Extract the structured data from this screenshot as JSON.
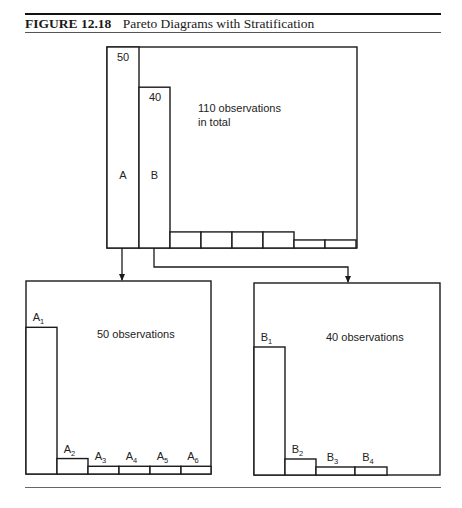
{
  "figure": {
    "number": "FIGURE 12.18",
    "title": "Pareto Diagrams with Stratification"
  },
  "chart_data": [
    {
      "type": "bar",
      "id": "overall",
      "annotation": [
        "110 observations",
        "in total"
      ],
      "categories": [
        "A",
        "B",
        "",
        "",
        "",
        "",
        "",
        ""
      ],
      "values": [
        50,
        40,
        4,
        4,
        4,
        4,
        2,
        2
      ],
      "value_labels": [
        "50",
        "40",
        "",
        "",
        "",
        "",
        "",
        ""
      ],
      "ylim": [
        0,
        50
      ],
      "grid": false,
      "total": 110
    },
    {
      "type": "bar",
      "id": "stratum-A",
      "annotation": [
        "50 observations"
      ],
      "categories": [
        "A1",
        "A2",
        "A3",
        "A4",
        "A5",
        "A6"
      ],
      "label_main": [
        "A",
        "A",
        "A",
        "A",
        "A",
        "A"
      ],
      "label_sub": [
        "1",
        "2",
        "3",
        "4",
        "5",
        "6"
      ],
      "values": [
        38,
        4,
        2,
        2,
        2,
        2
      ],
      "ylim": [
        0,
        50
      ],
      "grid": false,
      "total": 50
    },
    {
      "type": "bar",
      "id": "stratum-B",
      "annotation": [
        "40 observations"
      ],
      "categories": [
        "B1",
        "B2",
        "B3",
        "B4"
      ],
      "label_main": [
        "B",
        "B",
        "B",
        "B"
      ],
      "label_sub": [
        "1",
        "2",
        "3",
        "4"
      ],
      "values": [
        32,
        4,
        2,
        2
      ],
      "ylim": [
        0,
        48
      ],
      "grid": false,
      "total": 40
    }
  ],
  "arrows": [
    {
      "from": "A",
      "to": "stratum-A"
    },
    {
      "from": "B",
      "to": "stratum-B"
    }
  ]
}
